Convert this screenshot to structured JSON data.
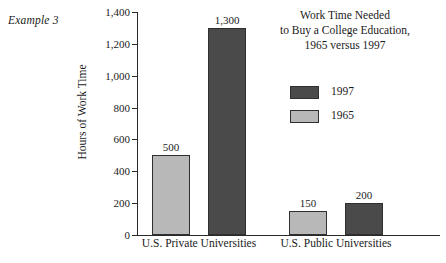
{
  "example_label": "Example 3",
  "colors": {
    "series_1997": "#4a4a4a",
    "series_1965": "#b8b8b8",
    "axis": "#2a2a2a",
    "background": "#ffffff",
    "bar_outline": "#2f2f2f"
  },
  "legend": {
    "position": "upper-right",
    "items": [
      {
        "label": "1997",
        "color": "#4a4a4a"
      },
      {
        "label": "1965",
        "color": "#b8b8b8"
      }
    ]
  },
  "chart_data": {
    "type": "bar",
    "title": "Work Time Needed to Buy a College Education, 1965 versus 1997",
    "title_lines": [
      "Work Time Needed",
      "to Buy a College Education,",
      "1965 versus 1997"
    ],
    "xlabel": "",
    "ylabel": "Hours of Work Time",
    "categories": [
      "U.S. Private Universities",
      "U.S. Public Universities"
    ],
    "series": [
      {
        "name": "1997",
        "color": "#4a4a4a",
        "values": [
          1300,
          200
        ]
      },
      {
        "name": "1965",
        "color": "#b8b8b8",
        "values": [
          500,
          150
        ]
      }
    ],
    "bar_order_in_group": [
      "1965",
      "1997"
    ],
    "data_labels": [
      "500",
      "1,300",
      "150",
      "200"
    ],
    "ylim": [
      0,
      1400
    ],
    "yticks": [
      0,
      200,
      400,
      600,
      800,
      1000,
      1200,
      1400
    ],
    "ytick_labels": [
      "0",
      "200",
      "400",
      "600",
      "800",
      "1,000",
      "1,200",
      "1,400"
    ],
    "grid": false,
    "legend_position": "upper-right"
  },
  "bars": [
    {
      "value": 1300,
      "label": "1,300",
      "series": "1997",
      "category": "U.S. Private Universities",
      "color": "#4a4a4a",
      "left_px": 71,
      "width_px": 38
    },
    {
      "value": 500,
      "label": "500",
      "series": "1965",
      "category": "U.S. Private Universities",
      "color": "#b8b8b8",
      "left_px": 15,
      "width_px": 38
    },
    {
      "value": 200,
      "label": "200",
      "series": "1997",
      "category": "U.S. Public Universities",
      "color": "#4a4a4a",
      "left_px": 208,
      "width_px": 38
    },
    {
      "value": 150,
      "label": "150",
      "series": "1965",
      "category": "U.S. Public Universities",
      "color": "#b8b8b8",
      "left_px": 152,
      "width_px": 38
    }
  ]
}
